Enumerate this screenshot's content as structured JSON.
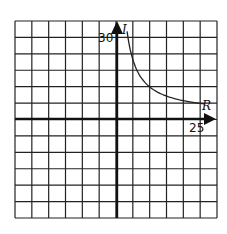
{
  "chart_data": {
    "type": "line",
    "title": "",
    "xlabel": "R",
    "ylabel": "I",
    "x_tick_labels": [
      {
        "value": 25,
        "label": "25"
      }
    ],
    "y_tick_labels": [
      {
        "value": 30,
        "label": "30"
      }
    ],
    "xlim": [
      -30,
      30
    ],
    "ylim": [
      -36,
      36
    ],
    "grid": true,
    "grid_cells": {
      "columns": 12,
      "rows": 12,
      "x_per_cell": 5,
      "y_per_cell": 6
    },
    "legend": null,
    "series": [
      {
        "name": "I vs R",
        "x": [
          3.3,
          4.2,
          5.1,
          7.4,
          9.9,
          15.4,
          20.5,
          26.5
        ],
        "y": [
          32.6,
          25.0,
          17.9,
          13.9,
          11.3,
          8.4,
          6.6,
          5.5
        ]
      }
    ]
  },
  "labels": {
    "y_tick": "30",
    "x_tick": "25",
    "y_var": "I",
    "x_var": "R"
  }
}
